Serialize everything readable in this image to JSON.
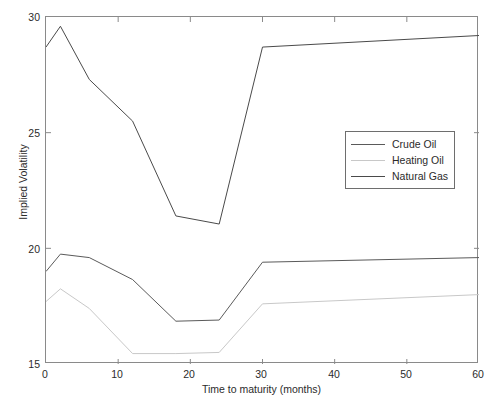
{
  "chart_data": {
    "type": "line",
    "title": "",
    "xlabel": "Time to maturity (months)",
    "ylabel": "Implied Volatility",
    "xlim": [
      0,
      60
    ],
    "ylim": [
      15,
      30
    ],
    "xticks": [
      0,
      10,
      20,
      30,
      40,
      50,
      60
    ],
    "yticks": [
      15,
      20,
      25,
      30
    ],
    "grid": false,
    "legend_position": "center-right",
    "series": [
      {
        "name": "Crude Oil",
        "color": "#5a5a5a",
        "x": [
          0,
          2,
          6,
          12,
          18,
          24,
          30,
          60
        ],
        "values": [
          19.0,
          19.75,
          19.6,
          18.65,
          16.85,
          16.9,
          19.4,
          19.6
        ]
      },
      {
        "name": "Heating Oil",
        "color": "#c8c8c8",
        "x": [
          0,
          2,
          6,
          12,
          18,
          24,
          30,
          60
        ],
        "values": [
          17.7,
          18.25,
          17.4,
          15.45,
          15.45,
          15.5,
          17.6,
          18.0
        ]
      },
      {
        "name": "Natural Gas",
        "color": "#4a4a4a",
        "x": [
          0,
          2,
          6,
          12,
          18,
          24,
          30,
          60
        ],
        "values": [
          28.7,
          29.6,
          27.3,
          25.5,
          21.4,
          21.05,
          28.7,
          29.2
        ]
      }
    ]
  },
  "axes": {
    "x_title": "Time to maturity (months)",
    "y_title": "Implied Volatility",
    "x_tick_labels": [
      "0",
      "10",
      "20",
      "30",
      "40",
      "50",
      "60"
    ],
    "y_tick_labels": [
      "15",
      "20",
      "25",
      "30"
    ]
  },
  "legend": {
    "entries": [
      {
        "label": "Crude Oil"
      },
      {
        "label": "Heating Oil"
      },
      {
        "label": "Natural Gas"
      }
    ]
  },
  "colors": {
    "crude_oil": "#5a5a5a",
    "heating_oil": "#c8c8c8",
    "natural_gas": "#4a4a4a",
    "axis": "#8a8a8a",
    "text": "#2b2b2b"
  }
}
